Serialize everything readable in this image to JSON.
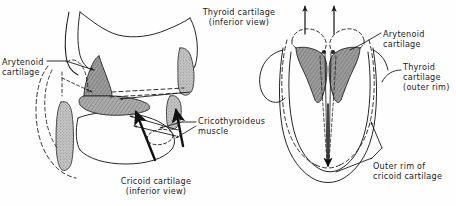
{
  "figure": {
    "background_color": "#fefefe",
    "line_color": "#1a1a1a",
    "shade_fill": "#9a9a9a",
    "shade_fill_light": "#c9c9c9"
  },
  "left_panel": {
    "title": "Thyroid cartilage\n(inferior view)",
    "bottom_caption": "Cricoid cartilage\n(inferior view)",
    "labels": {
      "arytenoid": "Arytenoid\ncartilage",
      "cricothyroideus": "Cricothyroideus\nmuscle"
    }
  },
  "right_panel": {
    "labels": {
      "arytenoid": "Arytenoid\ncartilage",
      "thyroid_outer_rim": "Thyroid\ncartilage\n(outer rim)",
      "cricoid_outer_rim": "Outer rim of\ncricoid cartilage"
    }
  }
}
